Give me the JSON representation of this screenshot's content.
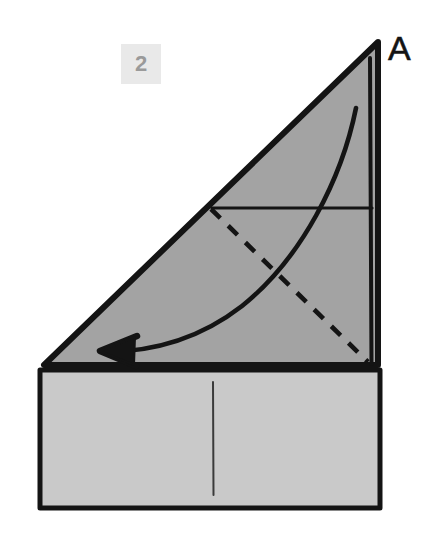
{
  "diagram": {
    "step_number": "2",
    "corner_label": "A",
    "canvas": {
      "width": 447,
      "height": 534
    },
    "colors": {
      "background": "#ffffff",
      "flap_fill": "#a3a3a3",
      "base_fill": "#c9c9c9",
      "ink": "#141414",
      "badge_bg": "#e9e9e9",
      "badge_text": "#9a9a9a"
    },
    "shapes": {
      "flap_triangle": {
        "name": "upper-triangular-flap",
        "fill": "#a3a3a3",
        "points": "378,42 44,365 378,365"
      },
      "base_rectangle": {
        "name": "lower-rectangle-base",
        "fill": "#c9c9c9",
        "points": "40,370 380,370 380,508 40,508"
      }
    },
    "lines": {
      "hypotenuse": {
        "name": "flap-hypotenuse-edge",
        "from": "378,42",
        "to": "44,365",
        "style": "solid"
      },
      "right_edge_outer": {
        "name": "flap-right-outer-edge",
        "from": "378,44",
        "to": "379,366",
        "style": "solid"
      },
      "right_edge_inner": {
        "name": "flap-right-inner-edge",
        "from": "371,60",
        "to": "372,366",
        "style": "solid"
      },
      "flap_bottom": {
        "name": "flap-bottom-edge",
        "from": "44,365",
        "to": "378,365",
        "style": "solid"
      },
      "horizontal_crease": {
        "name": "horizontal-crease-line",
        "from": "212,208",
        "to": "372,208",
        "style": "solid"
      },
      "dashed_diagonal": {
        "name": "valley-fold-dashed-line",
        "from": "211,209",
        "to": "368,363",
        "style": "dashed"
      },
      "base_vertical_fold": {
        "name": "base-vertical-fold-line",
        "from": "213,382",
        "to": "213,495",
        "style": "solid-thin"
      }
    },
    "arrow": {
      "name": "fold-direction-arrow",
      "description": "curved arrow indicating fold to the left",
      "path": "M 356,108 C 340,175 300,255 240,305 C 195,340 150,352 104,352",
      "head_tip": "100,351",
      "direction": "left"
    }
  }
}
